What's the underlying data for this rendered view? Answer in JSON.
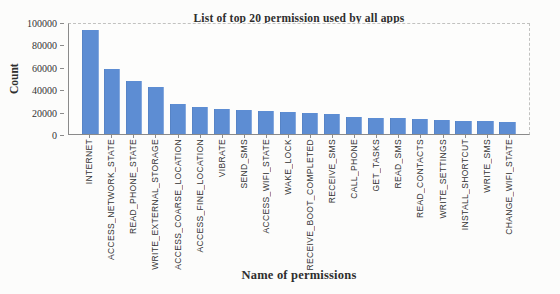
{
  "chart_data": {
    "type": "bar",
    "title": "List of top 20 permission used by all apps",
    "xlabel": "Name of permissions",
    "ylabel": "Count",
    "ylim": [
      0,
      100000
    ],
    "yticks": [
      0,
      20000,
      40000,
      60000,
      80000,
      100000
    ],
    "grid": false,
    "legend": "none",
    "categories": [
      "INTERNET",
      "ACCESS_NETWORK_STATE",
      "READ_PHONE_STATE",
      "WRITE_EXTERNAL_STORAGE",
      "ACCESS_COARSE_LOCATION",
      "ACCESS_FINE_LOCATION",
      "VIBRATE",
      "SEND_SMS",
      "ACCESS_WIFI_STATE",
      "WAKE_LOCK",
      "RECEIVE_BOOT_COMPLETED",
      "RECEIVE_SMS",
      "CALL_PHONE",
      "GET_TASKS",
      "READ_SMS",
      "READ_CONTACTS",
      "WRITE_SETTINGS",
      "INSTALL_SHORTCUT",
      "WRITE_SMS",
      "CHANGE_WIFI_STATE"
    ],
    "values": [
      95000,
      59000,
      48000,
      43000,
      27000,
      25000,
      23000,
      22000,
      21000,
      20000,
      19000,
      18000,
      15500,
      15000,
      14500,
      13500,
      12500,
      12000,
      11500,
      11000
    ],
    "colors": {
      "bar": "#5d8dd3",
      "axis": "#8a8a8a",
      "frame": "#c2c2c0",
      "text": "#333333",
      "background": "#fcfcfb"
    }
  }
}
